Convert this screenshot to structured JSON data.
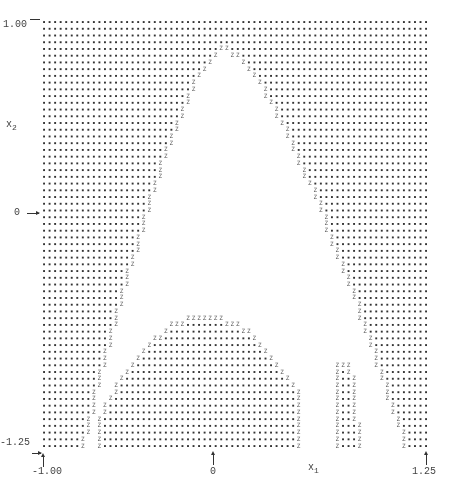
{
  "figure": {
    "type": "grid-plot",
    "y_axis": {
      "label": "x",
      "label_sub": "2",
      "ticks": [
        {
          "value": "1.00",
          "position": "top"
        },
        {
          "value": "0",
          "position": "middle"
        },
        {
          "value": "-1.25",
          "position": "bottom"
        }
      ]
    },
    "x_axis": {
      "label": "x",
      "label_sub": "1",
      "ticks": [
        {
          "value": "-1.00",
          "position": "left"
        },
        {
          "value": "0",
          "position": "middle"
        },
        {
          "value": "1.25",
          "position": "right"
        }
      ]
    },
    "symbols": {
      "region_a": ".",
      "boundary": "Z",
      "region_b": " "
    }
  },
  "chart_data": {
    "type": "heatmap",
    "title": "",
    "xlabel": "x1",
    "ylabel": "x2",
    "xlim": [
      -1.0,
      1.25
    ],
    "ylim": [
      -1.25,
      1.0
    ],
    "x_ticks": [
      "-1.00",
      "0",
      "1.25"
    ],
    "y_ticks": [
      "1.00",
      "0",
      "-1.25"
    ],
    "grid": false
  }
}
